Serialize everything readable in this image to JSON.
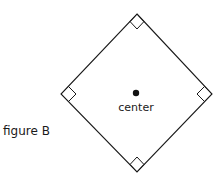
{
  "figure": {
    "caption": "figure B",
    "center_label": "center",
    "shape": "square",
    "orientation": "rotated 45 degrees (diamond)",
    "right_angle_markers": 4,
    "colors": {
      "stroke": "#1a1a1a",
      "background": "#ffffff"
    }
  }
}
